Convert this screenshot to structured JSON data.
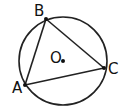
{
  "diagram": {
    "type": "inscribed-triangle-in-circle",
    "circle": {
      "cx": 63,
      "cy": 61,
      "r": 44,
      "stroke": "#222222"
    },
    "center": {
      "label": "O",
      "x": 63,
      "y": 61,
      "label_x": 50,
      "label_y": 63
    },
    "points": [
      {
        "label": "B",
        "x": 46,
        "y": 19,
        "label_x": 34,
        "label_y": 16
      },
      {
        "label": "A",
        "x": 25,
        "y": 85,
        "label_x": 12,
        "label_y": 93
      },
      {
        "label": "C",
        "x": 104,
        "y": 68,
        "label_x": 108,
        "label_y": 74
      }
    ],
    "edges": [
      [
        "A",
        "B"
      ],
      [
        "B",
        "C"
      ],
      [
        "C",
        "A"
      ]
    ]
  }
}
